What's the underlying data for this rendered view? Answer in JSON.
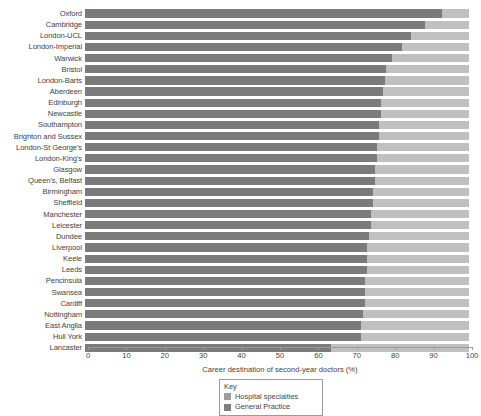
{
  "chart_data": {
    "type": "bar",
    "orientation": "horizontal",
    "stacked": true,
    "stack_mode": "percent",
    "title": "",
    "xlabel": "Career destination of second-year doctors (%)",
    "ylabel": "",
    "xlim": [
      0,
      100
    ],
    "xticks": [
      0,
      10,
      20,
      30,
      40,
      50,
      60,
      70,
      80,
      90,
      100
    ],
    "xtick_labels": [
      "0",
      "10",
      "20",
      "30",
      "40",
      "50",
      "60",
      "70",
      "80",
      "90",
      "100"
    ],
    "grid": false,
    "legend_position": "bottom-center",
    "categories": [
      "Oxford",
      "Cambridge",
      "London-UCL",
      "London-Imperial",
      "Warwick",
      "Bristol",
      "London-Barts",
      "Aberdeen",
      "Edinburgh",
      "Newcastle",
      "Southampton",
      "Brighton and Sussex",
      "London-St George's",
      "London-King's",
      "Glasgow",
      "Queen's, Belfast",
      "Birmingham",
      "Sheffield",
      "Manchester",
      "Leicester",
      "Dundee",
      "Liverpool",
      "Keele",
      "Leeds",
      "Pencinsula",
      "Swansea",
      "Cardiff",
      "Nottingham",
      "East Anglia",
      "Hull York",
      "Lancaster"
    ],
    "series": [
      {
        "name": "Hospital specialties",
        "color": "#7b7b7b",
        "values": [
          93.0,
          88.5,
          85.0,
          82.5,
          80.0,
          78.5,
          78.0,
          77.5,
          77.0,
          77.0,
          76.5,
          76.5,
          76.0,
          76.0,
          75.5,
          75.5,
          75.0,
          75.0,
          74.5,
          74.5,
          74.0,
          73.5,
          73.5,
          73.5,
          73.0,
          73.0,
          73.0,
          72.5,
          72.0,
          72.0,
          64.0
        ]
      },
      {
        "name": "General Practice",
        "color": "#c0c0c0",
        "values": [
          7.0,
          11.5,
          15.0,
          17.5,
          20.0,
          21.5,
          22.0,
          22.5,
          23.0,
          23.0,
          23.5,
          23.5,
          24.0,
          24.0,
          24.5,
          24.5,
          25.0,
          25.0,
          25.5,
          25.5,
          26.0,
          26.5,
          26.5,
          26.5,
          27.0,
          27.0,
          27.0,
          27.5,
          28.0,
          28.0,
          36.0
        ]
      }
    ],
    "legend": {
      "title": "Key",
      "entries": [
        {
          "label": "Hospital specialties",
          "color": "#9d9d9d"
        },
        {
          "label": "General Practice",
          "color": "#7e7e7e"
        }
      ]
    }
  }
}
